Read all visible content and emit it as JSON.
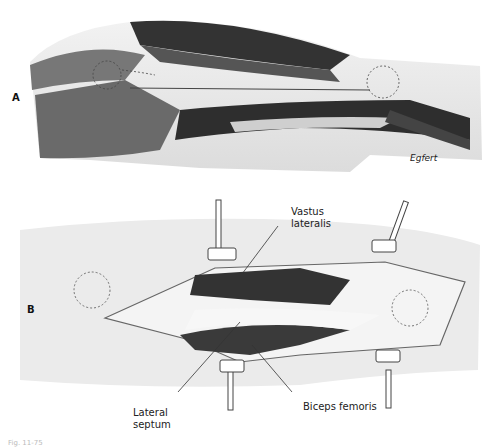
{
  "figure": {
    "panel_a_label": "A",
    "panel_b_label": "B",
    "signature": "Egfert",
    "labels": {
      "vastus_lateralis_1": "Vastus",
      "vastus_lateralis_2": "lateralis",
      "lateral_septum_1": "Lateral",
      "lateral_septum_2": "septum",
      "biceps_femoris": "Biceps femoris"
    },
    "caption": "Fig. 11-75"
  }
}
